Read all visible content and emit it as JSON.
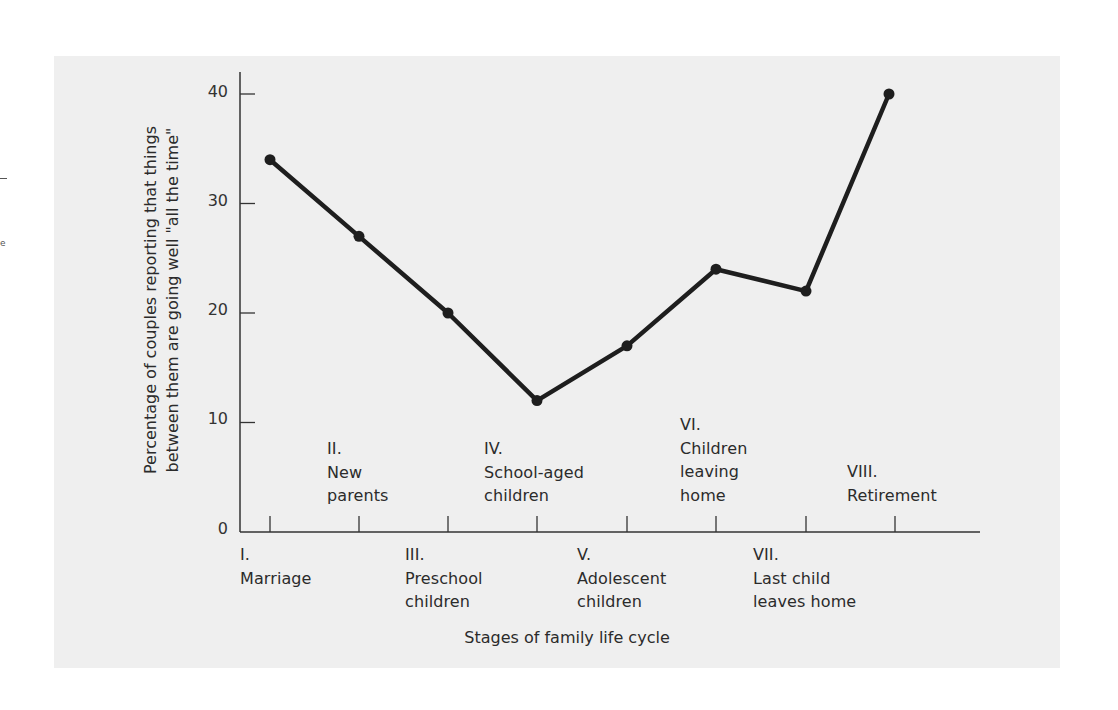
{
  "chart_data": {
    "type": "line",
    "title": "",
    "xlabel": "Stages of family life cycle",
    "ylabel": "Percentage of couples reporting that things between them are going well \"all the time\"",
    "ylabel_lines": [
      "Percentage of couples reporting that things",
      "between them are going well \"all the time\""
    ],
    "ylim": [
      0,
      40
    ],
    "yticks": [
      0,
      10,
      20,
      30,
      40
    ],
    "grid": false,
    "legend": null,
    "categories": [
      "I. Marriage",
      "II. New parents",
      "III. Preschool children",
      "IV. School-aged children",
      "V. Adolescent children",
      "VI. Children leaving home",
      "VII. Last child leaves home",
      "VIII. Retirement"
    ],
    "series": [
      {
        "name": "Couples reporting things going well all the time (%)",
        "values": [
          34,
          27,
          20,
          12,
          17,
          24,
          22,
          40
        ]
      }
    ]
  },
  "axis": {
    "yticks_labels": [
      "0",
      "10",
      "20",
      "30",
      "40"
    ]
  },
  "stages": {
    "s1": {
      "num": "I.",
      "line1": "Marriage",
      "line2": ""
    },
    "s2": {
      "num": "II.",
      "line1": "New",
      "line2": "parents"
    },
    "s3": {
      "num": "III.",
      "line1": "Preschool",
      "line2": "children"
    },
    "s4": {
      "num": "IV.",
      "line1": "School-aged",
      "line2": "children"
    },
    "s5": {
      "num": "V.",
      "line1": "Adolescent",
      "line2": "children"
    },
    "s6": {
      "num": "VI.",
      "line1": "Children",
      "line2": "leaving",
      "line3": "home"
    },
    "s7": {
      "num": "VII.",
      "line1": "Last child",
      "line2": "leaves home"
    },
    "s8": {
      "num": "VIII.",
      "line1": "Retirement"
    }
  },
  "colors": {
    "panel": "#efefef",
    "line": "#1e1e1e",
    "axis": "#333333"
  }
}
